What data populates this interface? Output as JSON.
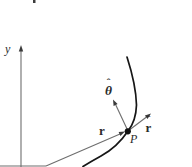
{
  "figure": {
    "type": "polar-coordinates-trajectory-diagram",
    "labels": {
      "y_axis": "y",
      "position_vector": "r",
      "radial_unit_vector": {
        "hat": "ˆ",
        "letter": "r"
      },
      "tangential_unit_vector": {
        "hat": "ˆ",
        "letter": "θ"
      },
      "point": "P"
    },
    "colors": {
      "line": "#6e6e6e",
      "arrowhead": "#3a3a3a",
      "curve": "#161616",
      "text": "#2b2b2b",
      "background": "#ffffff"
    }
  }
}
